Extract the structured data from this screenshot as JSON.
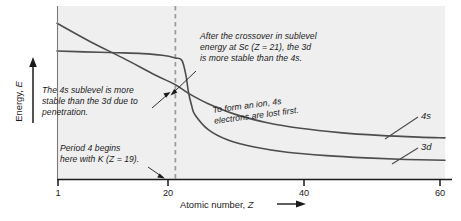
{
  "chart_data": {
    "type": "line",
    "title": "",
    "xlabel": "Atomic number, Z",
    "ylabel": "Energy, E",
    "xlim": [
      1,
      60
    ],
    "ylim": [
      0,
      1
    ],
    "grid": false,
    "legend_position": "right-inline",
    "xticks": [
      1,
      20,
      40,
      60
    ],
    "xticklabels": [
      "1",
      "20",
      "40",
      "60"
    ],
    "yticks": [],
    "yticklabels": [],
    "series": [
      {
        "name": "3d",
        "label": "3d",
        "color": "#4d4d4d",
        "description": "Nearly flat at high energy until Z=20, then drops steeply through the crossover at Z=21 and levels off low.",
        "x": [
          1,
          5,
          10,
          14,
          17,
          19,
          20,
          20.6,
          21,
          21.5,
          22,
          24,
          27,
          31,
          36,
          42,
          48,
          54,
          60
        ],
        "y": [
          0.74,
          0.735,
          0.73,
          0.725,
          0.715,
          0.7,
          0.685,
          0.6,
          0.5,
          0.42,
          0.37,
          0.285,
          0.225,
          0.185,
          0.155,
          0.135,
          0.122,
          0.113,
          0.108
        ]
      },
      {
        "name": "4s",
        "label": "4s",
        "color": "#4d4d4d",
        "description": "Starts highest at Z=1 and declines steadily, crossing the 3d curve near Z=21, then flattens above the 3d curve.",
        "x": [
          1,
          6,
          11,
          16,
          19,
          21,
          24,
          28,
          33,
          38,
          44,
          50,
          56,
          60
        ],
        "y": [
          0.9,
          0.795,
          0.7,
          0.6,
          0.545,
          0.495,
          0.435,
          0.375,
          0.325,
          0.293,
          0.268,
          0.252,
          0.242,
          0.238
        ]
      }
    ],
    "markers": [
      {
        "name": "period-4-line",
        "type": "vline",
        "x": 19,
        "style": "dashed",
        "color": "#9a9a9a"
      }
    ],
    "annotations": [
      {
        "id": "crossover",
        "text": "After the crossover in sublevel\nenergy at Sc (Z = 21), the 3d\nis more stable than the 4s."
      },
      {
        "id": "penetration",
        "text": "The 4s sublevel is more\nstable than the 3d due to\npenetration."
      },
      {
        "id": "ion",
        "text": "To form an ion, 4s\nelectrons are lost first."
      },
      {
        "id": "period4",
        "text": "Period 4 begins\nhere with K (Z = 19)."
      }
    ]
  },
  "axes": {
    "x_title_text": "Atomic number,",
    "x_title_symbol": "Z",
    "y_title_text": "Energy,",
    "y_title_symbol": "E"
  },
  "colors": {
    "plot_background": "#efefef",
    "curve": "#4d4d4d",
    "axis": "#1a1a1a",
    "dashed_line": "#9a9a9a",
    "text": "#1a1a1a"
  }
}
